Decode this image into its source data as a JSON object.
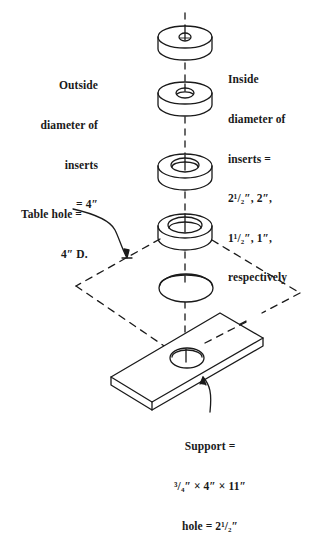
{
  "diagram": {
    "type": "exploded isometric assembly",
    "components": [
      {
        "name": "insert-1",
        "inside_diameter": "1\"",
        "outside_diameter": "4\""
      },
      {
        "name": "insert-2",
        "inside_diameter": "1 1/2\"",
        "outside_diameter": "4\""
      },
      {
        "name": "insert-3",
        "inside_diameter": "2\"",
        "outside_diameter": "4\""
      },
      {
        "name": "insert-4",
        "inside_diameter": "2 1/2\"",
        "outside_diameter": "4\""
      },
      {
        "name": "table-hole",
        "diameter": "4\""
      },
      {
        "name": "support",
        "size": "3/4\" × 4\" × 11\"",
        "hole": "2 1/2\""
      }
    ]
  },
  "labels": {
    "outside": {
      "lines": [
        "Outside",
        "diameter of",
        "inserts",
        "= 4″"
      ]
    },
    "inside": {
      "lines": [
        "Inside",
        "diameter of",
        "inserts =",
        "2¹/₂″, 2″,",
        "1¹/₂″, 1″,",
        "respectively"
      ]
    },
    "table_hole": {
      "lines": [
        "Table hole =",
        "4″ D."
      ]
    },
    "support": {
      "lines": [
        "Support =",
        "³/₄″ × 4″ × 11″",
        "hole = 2¹/₂″"
      ]
    }
  },
  "style": {
    "stroke": "#1a1a1a",
    "background": "#ffffff"
  }
}
